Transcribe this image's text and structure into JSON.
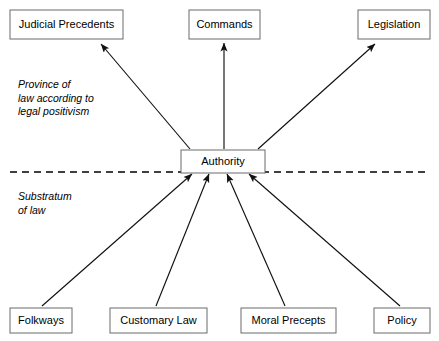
{
  "diagram": {
    "canvas": {
      "width": 439,
      "height": 341,
      "background": "#ffffff"
    },
    "colors": {
      "box_stroke": "#6b6b6b",
      "box_fill": "#ffffff",
      "edge": "#111111",
      "divider": "#000000",
      "text": "#000000"
    },
    "center_node": {
      "label": "Authority",
      "x": 181,
      "y": 150,
      "w": 84,
      "h": 23
    },
    "top_nodes": [
      {
        "label": "Judicial Precedents",
        "x": 10,
        "y": 10,
        "w": 113,
        "h": 29
      },
      {
        "label": "Commands",
        "x": 189,
        "y": 10,
        "w": 71,
        "h": 29
      },
      {
        "label": "Legislation",
        "x": 358,
        "y": 10,
        "w": 72,
        "h": 29
      }
    ],
    "bottom_nodes": [
      {
        "label": "Folkways",
        "x": 10,
        "y": 308,
        "w": 62,
        "h": 25
      },
      {
        "label": "Customary Law",
        "x": 110,
        "y": 308,
        "w": 97,
        "h": 25
      },
      {
        "label": "Moral Precepts",
        "x": 241,
        "y": 308,
        "w": 95,
        "h": 25
      },
      {
        "label": "Policy",
        "x": 374,
        "y": 308,
        "w": 56,
        "h": 25
      }
    ],
    "divider": {
      "x1": 10,
      "y1": 172,
      "x2": 428,
      "y2": 172,
      "style": "dashed"
    },
    "region_labels": [
      {
        "name": "upper-region-label",
        "x": 18,
        "y": 88,
        "lines": [
          "Province of",
          "law according to",
          "legal positivism"
        ]
      },
      {
        "name": "lower-region-label",
        "x": 18,
        "y": 200,
        "lines": [
          "Substratum",
          "of law"
        ]
      }
    ],
    "edges_up": [
      {
        "from": "Authority",
        "to": "Judicial Precedents",
        "x1": 190,
        "y1": 149,
        "x2": 101,
        "y2": 44
      },
      {
        "from": "Authority",
        "to": "Commands",
        "x1": 224,
        "y1": 149,
        "x2": 224,
        "y2": 43
      },
      {
        "from": "Authority",
        "to": "Legislation",
        "x1": 258,
        "y1": 149,
        "x2": 375,
        "y2": 44
      }
    ],
    "edges_in": [
      {
        "from": "Folkways",
        "to": "Authority",
        "x1": 42,
        "y1": 306,
        "x2": 192,
        "y2": 174
      },
      {
        "from": "Customary Law",
        "to": "Authority",
        "x1": 156,
        "y1": 306,
        "x2": 209,
        "y2": 174
      },
      {
        "from": "Moral Precepts",
        "to": "Authority",
        "x1": 285,
        "y1": 306,
        "x2": 227,
        "y2": 174
      },
      {
        "from": "Policy",
        "to": "Authority",
        "x1": 400,
        "y1": 306,
        "x2": 249,
        "y2": 174
      }
    ]
  }
}
